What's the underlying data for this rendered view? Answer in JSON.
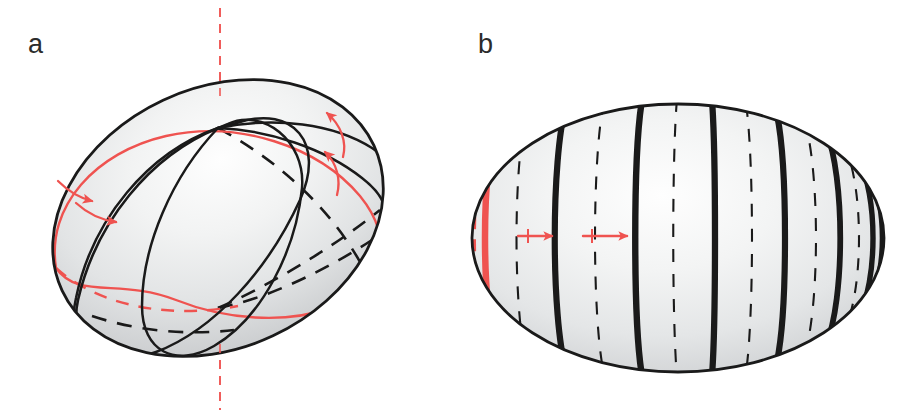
{
  "figure": {
    "background_color": "#ffffff",
    "width": 901,
    "height": 417
  },
  "colors": {
    "red_accent": "#ef5350",
    "red_accent_dark": "#e53935",
    "outline_black": "#1a1a1a",
    "surface_light": "#fdfdfd",
    "surface_mid": "#e2e3e4",
    "surface_dark": "#b9bcbe",
    "label_text": "#2b2b2b"
  },
  "panels": [
    {
      "id": "panel-a",
      "label": "a",
      "label_x": 28,
      "label_y": 53,
      "description": "Tilted ellipsoid with oblique great-circle curves and rotation axis",
      "ellipsoid": {
        "center_x": 218,
        "center_y": 218,
        "radius_x": 172,
        "radius_y": 130,
        "rotation_deg": -25
      },
      "rotation_axis": {
        "name": "rotation-axis",
        "style": "dashed",
        "color": "#ef5350",
        "x": 220,
        "y_top": 8,
        "y_bottom": 410
      },
      "curves": [
        {
          "name": "red-great-circle-front",
          "style": "solid",
          "color": "#ef5350"
        },
        {
          "name": "red-great-circle-back",
          "style": "dashed",
          "color": "#ef5350"
        },
        {
          "name": "black-meridian-one-front",
          "style": "solid",
          "color": "#1a1a1a"
        },
        {
          "name": "black-meridian-two-front",
          "style": "solid",
          "color": "#1a1a1a"
        },
        {
          "name": "black-meridian-one-back",
          "style": "dashed",
          "color": "#1a1a1a"
        },
        {
          "name": "black-meridian-two-back",
          "style": "dashed",
          "color": "#1a1a1a"
        }
      ],
      "arrows": [
        {
          "name": "arrow-upper-outer",
          "direction": "up-left",
          "style": "curved",
          "color": "#ef5350"
        },
        {
          "name": "arrow-upper-inner",
          "direction": "up-left",
          "style": "curved",
          "color": "#ef5350"
        },
        {
          "name": "arrow-left-outer",
          "direction": "down-right",
          "style": "curved",
          "color": "#ef5350"
        },
        {
          "name": "arrow-left-inner",
          "direction": "down-right",
          "style": "curved",
          "color": "#ef5350"
        }
      ]
    },
    {
      "id": "panel-b",
      "label": "b",
      "label_x": 478,
      "label_y": 53,
      "description": "Upright ellipsoid with a family of meridian arcs of decreasing spacing",
      "ellipsoid": {
        "center_x": 678,
        "center_y": 238,
        "radius_x": 206,
        "radius_y": 134,
        "rotation_deg": 0
      },
      "meridians": [
        {
          "name": "meridian-red-dashed",
          "offset": -0.965,
          "style": "dashed",
          "color": "#ef5350",
          "width": 6
        },
        {
          "name": "meridian-red-solid",
          "offset": -0.9,
          "style": "solid",
          "color": "#ef5350",
          "width": 6
        },
        {
          "name": "meridian-back-1",
          "offset": -0.76,
          "style": "dashed",
          "color": "#1a1a1a",
          "width": 2
        },
        {
          "name": "meridian-front-1",
          "offset": -0.58,
          "style": "solid",
          "color": "#1a1a1a",
          "width": 6
        },
        {
          "name": "meridian-back-2",
          "offset": -0.4,
          "style": "dashed",
          "color": "#1a1a1a",
          "width": 2
        },
        {
          "name": "meridian-front-2",
          "offset": -0.215,
          "style": "solid",
          "color": "#1a1a1a",
          "width": 6
        },
        {
          "name": "meridian-back-3",
          "offset": -0.04,
          "style": "dashed",
          "color": "#1a1a1a",
          "width": 2
        },
        {
          "name": "meridian-front-3",
          "offset": 0.13,
          "style": "solid",
          "color": "#1a1a1a",
          "width": 6
        },
        {
          "name": "meridian-back-4",
          "offset": 0.3,
          "style": "dashed",
          "color": "#1a1a1a",
          "width": 2
        },
        {
          "name": "meridian-front-4",
          "offset": 0.45,
          "style": "solid",
          "color": "#1a1a1a",
          "width": 6
        },
        {
          "name": "meridian-back-5",
          "offset": 0.59,
          "style": "dashed",
          "color": "#1a1a1a",
          "width": 2
        },
        {
          "name": "meridian-front-5",
          "offset": 0.7,
          "style": "solid",
          "color": "#1a1a1a",
          "width": 6
        },
        {
          "name": "meridian-back-6",
          "offset": 0.8,
          "style": "dashed",
          "color": "#1a1a1a",
          "width": 2
        },
        {
          "name": "meridian-front-6",
          "offset": 0.88,
          "style": "solid",
          "color": "#1a1a1a",
          "width": 6
        },
        {
          "name": "meridian-front-7",
          "offset": 0.955,
          "style": "solid",
          "color": "#1a1a1a",
          "width": 5
        }
      ],
      "arrows": [
        {
          "name": "arrow-propagation-1",
          "direction": "right",
          "style": "straight",
          "color": "#ef5350",
          "x_start": 518,
          "x_end": 552,
          "y": 236
        },
        {
          "name": "arrow-propagation-2",
          "direction": "right",
          "style": "straight",
          "color": "#ef5350",
          "x_start": 583,
          "x_end": 627,
          "y": 236
        }
      ]
    }
  ]
}
